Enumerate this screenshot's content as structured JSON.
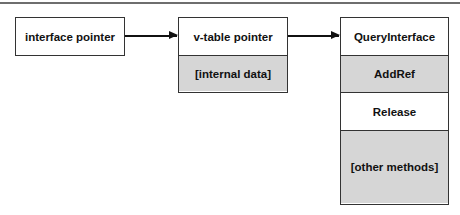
{
  "diagram": {
    "boxes": [
      {
        "id": "interface-pointer",
        "cells": [
          {
            "label": "interface  pointer",
            "fill": "white"
          }
        ]
      },
      {
        "id": "vtable-pointer",
        "cells": [
          {
            "label": "v-table  pointer",
            "fill": "white"
          },
          {
            "label": "[internal  data]",
            "fill": "gray"
          }
        ]
      },
      {
        "id": "vtable",
        "cells": [
          {
            "label": "QueryInterface",
            "fill": "white"
          },
          {
            "label": "AddRef",
            "fill": "gray"
          },
          {
            "label": "Release",
            "fill": "white"
          },
          {
            "label": "[other  methods]",
            "fill": "gray"
          }
        ]
      }
    ],
    "edges": [
      {
        "from": "interface-pointer",
        "to": "vtable-pointer"
      },
      {
        "from": "vtable-pointer",
        "to": "vtable"
      }
    ],
    "colors": {
      "gray_fill": "#d6d6d6",
      "stroke": "#333333"
    }
  }
}
